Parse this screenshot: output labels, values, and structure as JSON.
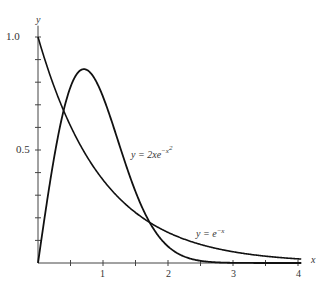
{
  "chart_data": {
    "type": "line",
    "title": "",
    "xlabel": "x",
    "ylabel": "y",
    "xlim": [
      0,
      4.05
    ],
    "ylim": [
      0,
      1.0
    ],
    "x_ticks": [
      0,
      0.5,
      1,
      1.5,
      2,
      2.5,
      3,
      3.5,
      4
    ],
    "x_tick_labels": [
      "",
      "",
      "1",
      "",
      "2",
      "",
      "3",
      "",
      "4"
    ],
    "y_ticks": [
      0,
      0.1,
      0.2,
      0.3,
      0.4,
      0.5,
      0.6,
      0.7,
      0.8,
      0.9,
      1.0
    ],
    "y_tick_labels": [
      "",
      "",
      "",
      "",
      "",
      "0.5",
      "",
      "",
      "",
      "",
      "1.0"
    ],
    "grid": false,
    "legend": "none (curves labeled inline)",
    "series": [
      {
        "name": "y = e^{-x}",
        "formula": "exp(-x)",
        "x": [
          0,
          0.5,
          1,
          1.5,
          2,
          2.5,
          3,
          3.5,
          4
        ],
        "values": [
          1.0,
          0.607,
          0.368,
          0.223,
          0.135,
          0.082,
          0.05,
          0.03,
          0.018
        ]
      },
      {
        "name": "y = 2xe^{-x^2}",
        "formula": "2*x*exp(-x*x)",
        "x": [
          0,
          0.25,
          0.5,
          0.707,
          1,
          1.5,
          2,
          2.5,
          3,
          4
        ],
        "values": [
          0,
          0.47,
          0.779,
          0.858,
          0.736,
          0.316,
          0.073,
          0.01,
          0.001,
          0.0
        ]
      }
    ],
    "annotations": [
      {
        "text": "y = 2xe^{-x^2}",
        "near_x": 1.9,
        "near_y": 0.5
      },
      {
        "text": "y = e^{-x}",
        "near_x": 2.8,
        "near_y": 0.1
      }
    ]
  },
  "labels": {
    "y_axis": "y",
    "x_axis": "x",
    "y_1": "1.0",
    "y_05": "0.5",
    "x_1": "1",
    "x_2": "2",
    "x_3": "3",
    "x_4": "4",
    "curve1_prefix": "y = 2xe",
    "curve1_sup": "−x",
    "curve1_sup2": "2",
    "curve2_prefix": "y = e",
    "curve2_sup": "−x"
  }
}
